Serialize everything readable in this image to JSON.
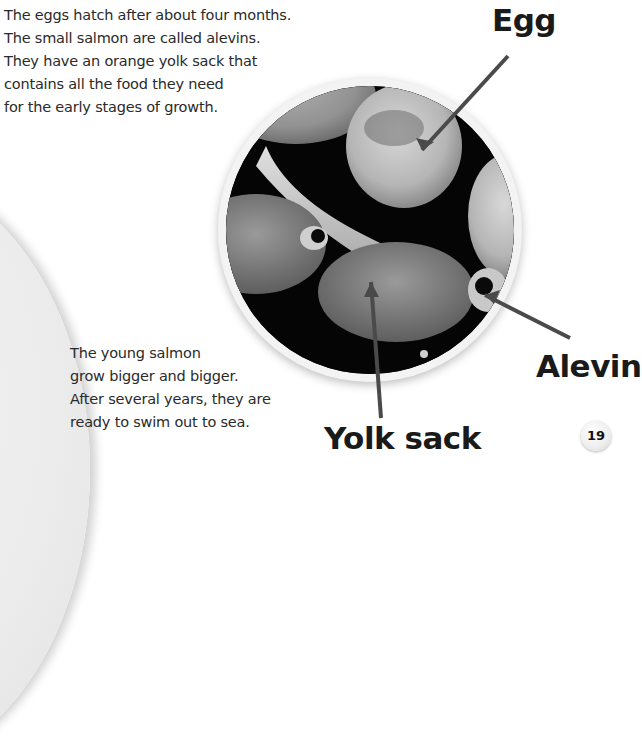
{
  "page": {
    "number": "19",
    "paragraphs": [
      {
        "lines": [
          "The eggs hatch after about four months.",
          "The small salmon are called alevins.",
          "They have an orange yolk sack that",
          "contains all the food they need",
          "for the early stages of growth."
        ]
      },
      {
        "lines": [
          "The young salmon",
          "grow bigger and bigger.",
          "After several years, they are",
          "ready to swim out to sea."
        ]
      }
    ],
    "photo": {
      "description": "Circular black-and-white photo of salmon eggs and alevins with yolk sacks",
      "labels": [
        "Egg",
        "Alevin",
        "Yolk sack"
      ]
    },
    "colors": {
      "text": "#2a2a2a",
      "label": "#1a1a1a",
      "leader_line": "#4a4a4a",
      "photo_background": "#050505"
    }
  }
}
